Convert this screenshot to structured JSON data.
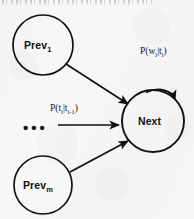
{
  "figure": {
    "kind": "probabilistic-state-transition-diagram",
    "background_color": "#f7f7f8",
    "ink_color": "#111114",
    "top_clipped_text_note": "illegible clipped text row"
  },
  "nodes": [
    {
      "id": "prev-first",
      "label_main": "Prev",
      "label_sub": "1",
      "cx": 43,
      "cy": 45,
      "r": 30
    },
    {
      "id": "prev-last",
      "label_main": "Prev",
      "label_sub": "m",
      "cx": 43,
      "cy": 185,
      "r": 29
    },
    {
      "id": "next",
      "label_main": "Next",
      "label_sub": "",
      "cx": 153,
      "cy": 121,
      "r": 31
    }
  ],
  "ellipsis": {
    "text": "•••"
  },
  "edges": [
    {
      "id": "edge-prev-first-to-next",
      "from": "prev-first",
      "to": "next",
      "style": "straight-arrow"
    },
    {
      "id": "edge-ellipsis-to-next",
      "from": "ellipsis",
      "to": "next",
      "style": "straight-arrow"
    },
    {
      "id": "edge-prev-last-to-next",
      "from": "prev-last",
      "to": "next",
      "style": "straight-arrow"
    },
    {
      "id": "edge-next-self-loop",
      "from": "next",
      "to": "next",
      "style": "self-loop-arc"
    }
  ],
  "labels": {
    "transition_probability": {
      "prefix": "P(t",
      "sub1": "i",
      "mid": "|t",
      "sub2": "i-1",
      "suffix": ")",
      "plain": "P(t_i|t_i-1)"
    },
    "emission_probability": {
      "prefix": "P(w",
      "sub1": "i",
      "mid": "|t",
      "sub2": "i",
      "suffix": ")",
      "plain": "P(w_i|t_i)"
    }
  }
}
